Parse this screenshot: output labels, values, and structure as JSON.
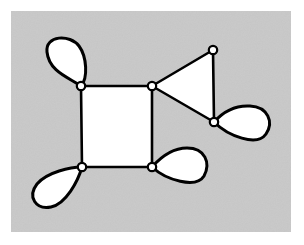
{
  "figure": {
    "canvas": {
      "width": 304,
      "height": 245
    },
    "background_color": "#ffffff"
  },
  "panel": {
    "x": 11,
    "y": 11,
    "width": 280,
    "height": 221,
    "fill_color": "#c9c9c9",
    "label": "shaded background panel"
  },
  "style": {
    "stroke_color": "#000000",
    "face_fill_color": "#ffffff",
    "loop_fill_color": "#ffffff",
    "vertex_fill_color": "#ffffff",
    "edge_width": 2.6,
    "loop_width": 3.0,
    "vertex_radius": 4.2,
    "vertex_stroke_width": 2.2
  },
  "chart_data": {
    "type": "diagram",
    "vertex_count": 6,
    "edge_count": 10,
    "loop_count": 4,
    "face_count": 3,
    "vertices": [
      {
        "id": "v1",
        "label": "top-left",
        "x": 81,
        "y": 86,
        "degree": 4
      },
      {
        "id": "v2",
        "label": "top-right-square",
        "x": 152,
        "y": 86,
        "degree": 4
      },
      {
        "id": "v3",
        "label": "triangle-apex",
        "x": 213,
        "y": 50,
        "degree": 2
      },
      {
        "id": "v4",
        "label": "right-loop-vertex",
        "x": 214,
        "y": 122,
        "degree": 4
      },
      {
        "id": "v5",
        "label": "bottom-left",
        "x": 82,
        "y": 167,
        "degree": 4
      },
      {
        "id": "v6",
        "label": "bottom-right-square",
        "x": 152,
        "y": 167,
        "degree": 4
      }
    ],
    "edges": [
      {
        "from": "v1",
        "to": "v2",
        "kind": "straight"
      },
      {
        "from": "v2",
        "to": "v6",
        "kind": "straight"
      },
      {
        "from": "v6",
        "to": "v5",
        "kind": "straight"
      },
      {
        "from": "v5",
        "to": "v1",
        "kind": "straight"
      },
      {
        "from": "v2",
        "to": "v3",
        "kind": "straight"
      },
      {
        "from": "v3",
        "to": "v4",
        "kind": "straight"
      },
      {
        "from": "v4",
        "to": "v2",
        "kind": "straight"
      }
    ],
    "loops": [
      {
        "id": "loop-v1",
        "at": "v1",
        "direction": "up-left",
        "path": "M 81 86 C 70 78 49 72 47 52 C 45 35 70 34 79 46 C 87 57 88 78 81 86 Z"
      },
      {
        "id": "loop-v5",
        "at": "v5",
        "direction": "down-left",
        "path": "M 82 167 C 71 167 47 172 37 184 C 27 197 36 210 51 207 C 66 204 78 181 82 167 Z"
      },
      {
        "id": "loop-v6",
        "at": "v6",
        "direction": "right",
        "path": "M 152 167 C 160 158 171 148 187 148 C 205 148 211 163 204 176 C 196 189 166 180 152 167 Z"
      },
      {
        "id": "loop-v4",
        "at": "v4",
        "direction": "right-down",
        "path": "M 214 122 C 222 113 234 105 250 106 C 268 107 274 122 266 134 C 257 147 228 136 214 122 Z"
      }
    ],
    "faces": [
      {
        "id": "square-face",
        "shape": "quadrilateral",
        "vertices": [
          "v1",
          "v2",
          "v6",
          "v5"
        ],
        "fill": "#ffffff"
      },
      {
        "id": "triangle-face",
        "shape": "triangle",
        "vertices": [
          "v2",
          "v3",
          "v4"
        ],
        "fill": "#ffffff"
      },
      {
        "id": "outer-face",
        "shape": "unbounded",
        "fill": "#c9c9c9"
      }
    ]
  }
}
